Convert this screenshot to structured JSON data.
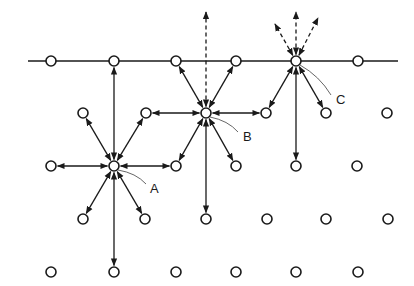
{
  "diagram": {
    "colors": {
      "stroke": "#1a1a1a",
      "background": "#ffffff"
    },
    "surface_line": {
      "x1": 28,
      "y1": 61,
      "x2": 398,
      "y2": 61
    },
    "sites": [
      [
        51,
        61
      ],
      [
        114,
        61
      ],
      [
        176,
        61
      ],
      [
        236,
        61
      ],
      [
        296,
        61
      ],
      [
        358,
        61
      ],
      [
        83,
        113
      ],
      [
        146,
        113
      ],
      [
        206,
        113
      ],
      [
        266,
        113
      ],
      [
        326,
        113
      ],
      [
        387,
        113
      ],
      [
        51,
        166
      ],
      [
        114,
        166
      ],
      [
        176,
        166
      ],
      [
        236,
        166
      ],
      [
        296,
        166
      ],
      [
        357,
        166
      ],
      [
        83,
        219
      ],
      [
        145,
        219
      ],
      [
        206,
        219
      ],
      [
        267,
        219
      ],
      [
        326,
        219
      ],
      [
        388,
        219
      ],
      [
        51,
        272
      ],
      [
        114,
        272
      ],
      [
        176,
        272
      ],
      [
        236,
        272
      ],
      [
        296,
        272
      ],
      [
        358,
        272
      ]
    ],
    "labels": [
      {
        "id": "A",
        "text": "A",
        "x": 150,
        "y": 193,
        "leader_from": [
          118,
          170
        ],
        "leader_to": [
          146,
          184
        ]
      },
      {
        "id": "B",
        "text": "B",
        "x": 243,
        "y": 141,
        "leader_from": [
          210,
          117
        ],
        "leader_to": [
          238,
          132
        ]
      },
      {
        "id": "C",
        "text": "C",
        "x": 336,
        "y": 104,
        "leader_from": [
          300,
          65
        ],
        "leader_to": [
          331,
          95
        ]
      }
    ],
    "arrows_solid": [
      {
        "from": [
          114,
          166
        ],
        "to": [
          51,
          166
        ],
        "double": true
      },
      {
        "from": [
          114,
          166
        ],
        "to": [
          176,
          166
        ],
        "double": true
      },
      {
        "from": [
          114,
          166
        ],
        "to": [
          83,
          113
        ],
        "double": true
      },
      {
        "from": [
          114,
          166
        ],
        "to": [
          146,
          113
        ],
        "double": true
      },
      {
        "from": [
          114,
          166
        ],
        "to": [
          83,
          219
        ],
        "double": true
      },
      {
        "from": [
          114,
          166
        ],
        "to": [
          145,
          219
        ],
        "double": true
      },
      {
        "from": [
          114,
          166
        ],
        "to": [
          114,
          61
        ],
        "double": true
      },
      {
        "from": [
          114,
          166
        ],
        "to": [
          114,
          272
        ],
        "double": true
      },
      {
        "from": [
          206,
          113
        ],
        "to": [
          146,
          113
        ],
        "double": true
      },
      {
        "from": [
          206,
          113
        ],
        "to": [
          266,
          113
        ],
        "double": true
      },
      {
        "from": [
          206,
          113
        ],
        "to": [
          176,
          61
        ],
        "double": true
      },
      {
        "from": [
          206,
          113
        ],
        "to": [
          236,
          61
        ],
        "double": true
      },
      {
        "from": [
          206,
          113
        ],
        "to": [
          176,
          166
        ],
        "double": true
      },
      {
        "from": [
          206,
          113
        ],
        "to": [
          236,
          166
        ],
        "double": true
      },
      {
        "from": [
          206,
          113
        ],
        "to": [
          206,
          219
        ],
        "double": true
      },
      {
        "from": [
          296,
          61
        ],
        "to": [
          266,
          113
        ],
        "double": true
      },
      {
        "from": [
          296,
          61
        ],
        "to": [
          326,
          113
        ],
        "double": true
      },
      {
        "from": [
          296,
          61
        ],
        "to": [
          296,
          166
        ],
        "double": true
      }
    ],
    "arrows_dashed": [
      {
        "from": [
          206,
          113
        ],
        "to": [
          206,
          12
        ]
      },
      {
        "from": [
          296,
          61
        ],
        "to": [
          296,
          12
        ]
      },
      {
        "from": [
          296,
          61
        ],
        "to": [
          275,
          24
        ]
      },
      {
        "from": [
          296,
          61
        ],
        "to": [
          318,
          18
        ]
      }
    ]
  }
}
